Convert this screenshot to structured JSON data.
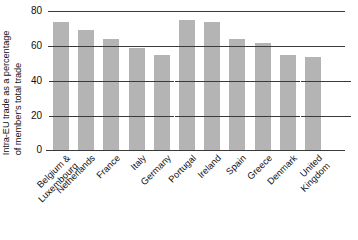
{
  "chart_data": {
    "type": "bar",
    "title": "",
    "subtitle": "",
    "xlabel": "",
    "ylabel": "Intra-EU trade as a percentage of member's total trade",
    "ylabel_lines": [
      "Intra-EU trade as a percentage",
      "of member's total trade"
    ],
    "ylim": [
      0,
      80
    ],
    "ytick_labels": [
      "80",
      "60",
      "40",
      "20",
      "0"
    ],
    "ytick_values": [
      80,
      60,
      40,
      20,
      0
    ],
    "grid": "horizontal gridlines at 80 and 60; short tick dashes at 40 and 20",
    "legend": "none",
    "bar_color": "#b4b4b4",
    "axis_color": "#3a3a3a",
    "categories": [
      "Belgium & Luxembourg",
      "Netherlands",
      "France",
      "Italy",
      "Germany",
      "Portugal",
      "Ireland",
      "Spain",
      "Greece",
      "Denmark",
      "United Kingdom"
    ],
    "category_lines": [
      [
        "Belgium &",
        "Luxembourg"
      ],
      [
        "Netherlands"
      ],
      [
        "France"
      ],
      [
        "Italy"
      ],
      [
        "Germany"
      ],
      [
        "Portugal"
      ],
      [
        "Ireland"
      ],
      [
        "Spain"
      ],
      [
        "Greece"
      ],
      [
        "Denmark"
      ],
      [
        "United",
        "Kingdom"
      ]
    ],
    "values": [
      74,
      69,
      64,
      59,
      55,
      75,
      74,
      64,
      62,
      55,
      54
    ]
  }
}
